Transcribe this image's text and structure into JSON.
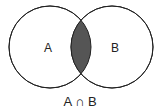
{
  "diagram": {
    "type": "venn",
    "sets": [
      {
        "label": "A",
        "cx": 50,
        "cy": 47,
        "r": 41
      },
      {
        "label": "B",
        "cx": 112,
        "cy": 47,
        "r": 41
      }
    ],
    "intersection_label": "A ∩ B",
    "colors": {
      "stroke": "#222222",
      "fill": "#ffffff",
      "intersection": "#555555"
    }
  }
}
